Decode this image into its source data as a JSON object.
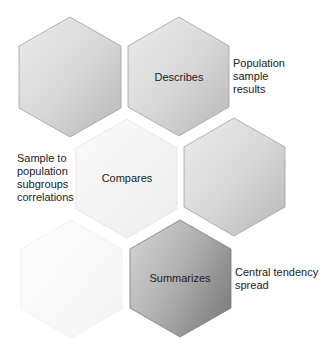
{
  "diagram": {
    "hexagons": [
      {
        "id": "hex-1",
        "label": "",
        "shade": "medium"
      },
      {
        "id": "hex-2",
        "label": "Describes",
        "shade": "medium"
      },
      {
        "id": "hex-3",
        "label": "Compares",
        "shade": "light"
      },
      {
        "id": "hex-4",
        "label": "",
        "shade": "medium"
      },
      {
        "id": "hex-5",
        "label": "",
        "shade": "very-light"
      },
      {
        "id": "hex-6",
        "label": "Summarizes",
        "shade": "dark"
      }
    ],
    "notes": {
      "describes": [
        "Population",
        "sample",
        "results"
      ],
      "compares": [
        "Sample to",
        "population",
        "subgroups",
        "correlations"
      ],
      "summarizes": [
        "Central tendency",
        "spread"
      ]
    }
  },
  "colors": {
    "outline": "#9a9a9a",
    "text": "#222222"
  }
}
